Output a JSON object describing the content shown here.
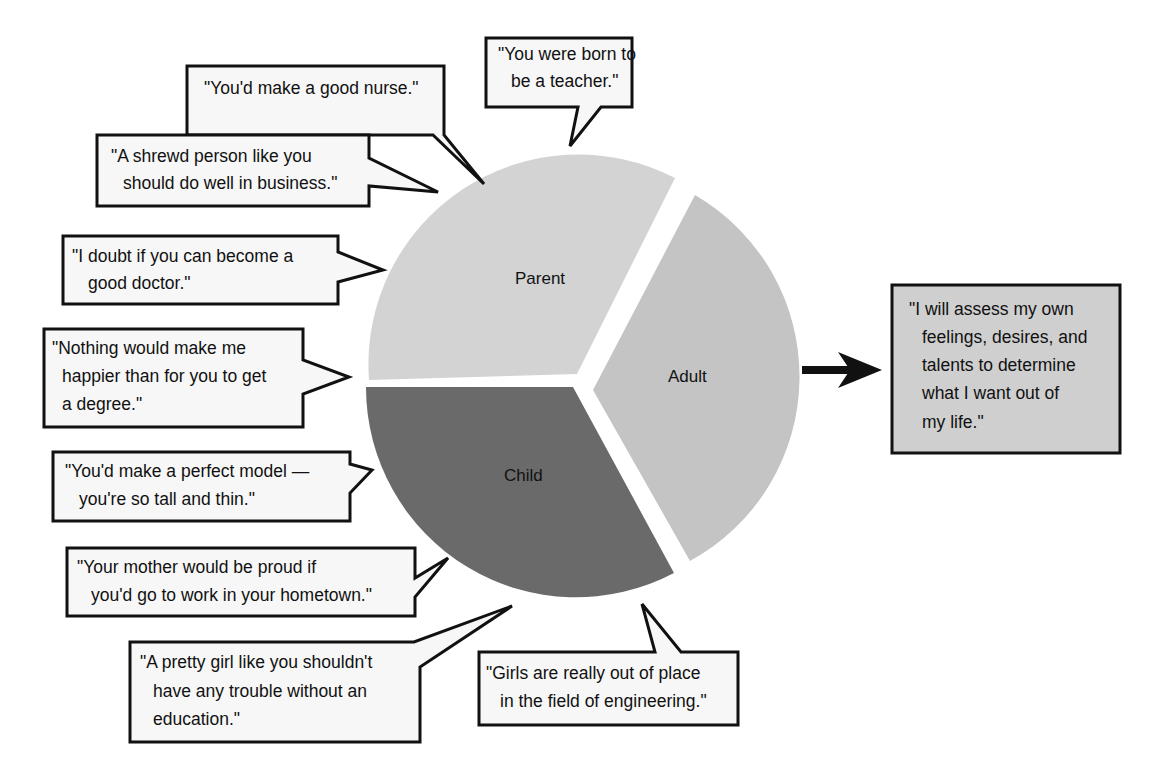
{
  "diagram": {
    "type": "transactional-analysis-ego-states",
    "pie": {
      "center": [
        579,
        390
      ],
      "radius": 212,
      "slices": [
        {
          "id": "parent",
          "label": "Parent",
          "color": "#d2d2d2",
          "start_deg": 180,
          "end_deg": 302
        },
        {
          "id": "adult",
          "label": "Adult",
          "color": "#c6c6c6",
          "start_deg": 302,
          "end_deg": 418
        },
        {
          "id": "child",
          "label": "Child",
          "color": "#6b6b6b",
          "start_deg": 418,
          "end_deg": 540
        }
      ]
    },
    "parent_messages": [
      {
        "id": "nurse",
        "lines": [
          "\"You'd make a good nurse.\""
        ]
      },
      {
        "id": "teacher",
        "lines": [
          "\"You were born to",
          "be a teacher.\""
        ]
      },
      {
        "id": "business",
        "lines": [
          "\"A shrewd person like you",
          "should do well in business.\""
        ]
      },
      {
        "id": "doctor",
        "lines": [
          "\"I doubt if you can become a",
          "good doctor.\""
        ]
      },
      {
        "id": "degree",
        "lines": [
          "\"Nothing would make me",
          "happier than for you to get",
          "a degree.\""
        ]
      }
    ],
    "child_messages": [
      {
        "id": "model",
        "lines": [
          "\"You'd make a perfect model —",
          "you're so tall and thin.\""
        ]
      },
      {
        "id": "hometown",
        "lines": [
          "\"Your mother would be proud if",
          "you'd go to work in your hometown.\""
        ]
      },
      {
        "id": "education",
        "lines": [
          "\"A pretty girl like you shouldn't",
          "have any trouble without an",
          "education.\""
        ]
      },
      {
        "id": "engineering",
        "lines": [
          "\"Girls are really out of place",
          "in the field of engineering.\""
        ]
      }
    ],
    "adult_output": {
      "lines": [
        "\"I will assess my own",
        "feelings, desires, and",
        "talents to determine",
        "what I want out of",
        "my life.\""
      ],
      "fill": "#cfcfcf"
    },
    "arrow": {
      "from": "adult",
      "to": "adult_output",
      "direction": "right"
    }
  }
}
